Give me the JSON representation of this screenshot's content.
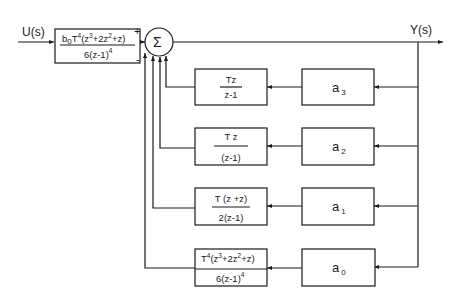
{
  "diagram": {
    "type": "block-diagram",
    "input_label": "U(s)",
    "output_label": "Y(s)",
    "summing_junction": {
      "symbol": "Σ",
      "plus_sign": "+",
      "minus_sign": "-"
    },
    "forward_block": {
      "numerator": "b0T4(z3+2z2+z)",
      "numerator_parts": {
        "b": "b",
        "b_sub": "0",
        "T": "T",
        "T_sup": "4",
        "open": "(z",
        "z3_sup": "3",
        "mid": "+2z",
        "z2_sup": "2",
        "end": "+z)"
      },
      "denominator": "6(z-1)4",
      "denominator_parts": {
        "base": "6(z-1)",
        "sup": "4"
      }
    },
    "feedback_rows": [
      {
        "gain_block": {
          "label": "a",
          "subscript": "3"
        },
        "transfer_block": {
          "numerator": "Tz",
          "denominator": "z-1"
        }
      },
      {
        "gain_block": {
          "label": "a",
          "subscript": "2"
        },
        "transfer_block": {
          "numerator": "T z",
          "denominator": "(z-1)"
        }
      },
      {
        "gain_block": {
          "label": "a",
          "subscript": "1"
        },
        "transfer_block": {
          "numerator": "T (z +z)",
          "denominator": "2(z-1)"
        }
      },
      {
        "gain_block": {
          "label": "a",
          "subscript": "0"
        },
        "transfer_block": {
          "numerator": "T4(z3+2z2+z)",
          "numerator_parts": {
            "T": "T",
            "T_sup": "4",
            "open": "(z",
            "z3_sup": "3",
            "mid": "+2z",
            "z2_sup": "2",
            "end": "+z)"
          },
          "denominator": "6(z-1)4",
          "denominator_parts": {
            "base": "6(z-1)",
            "sup": "4"
          }
        }
      }
    ]
  }
}
